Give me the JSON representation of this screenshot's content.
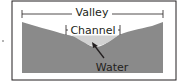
{
  "diagram": {
    "labels": {
      "valley": "Valley",
      "channel": "Channel",
      "water": "Water"
    },
    "colors": {
      "border": "#231f20",
      "ground": "#8a8a8a",
      "water": "#d2d2d2",
      "background": "#ffffff"
    }
  }
}
